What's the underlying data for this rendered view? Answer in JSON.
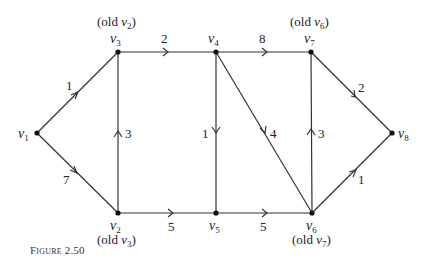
{
  "figure": {
    "caption": "Figure 2.50"
  },
  "nodes": [
    {
      "id": "v1",
      "label": "v",
      "sub": "1",
      "x": 37,
      "y": 133,
      "old": ""
    },
    {
      "id": "v2",
      "label": "v",
      "sub": "2",
      "x": 118,
      "y": 213,
      "old": "(old v3)",
      "old_main": "(old ",
      "old_v": "v",
      "old_sub": "3",
      "old_end": ")"
    },
    {
      "id": "v3",
      "label": "v",
      "sub": "3",
      "x": 118,
      "y": 52,
      "old": "(old v2)",
      "old_main": "(old ",
      "old_v": "v",
      "old_sub": "2",
      "old_end": ")"
    },
    {
      "id": "v4",
      "label": "v",
      "sub": "4",
      "x": 216,
      "y": 52,
      "old": ""
    },
    {
      "id": "v5",
      "label": "v",
      "sub": "5",
      "x": 216,
      "y": 213,
      "old": ""
    },
    {
      "id": "v6",
      "label": "v",
      "sub": "6",
      "x": 312,
      "y": 213,
      "old": "(old v7)",
      "old_main": "(old ",
      "old_v": "v",
      "old_sub": "7",
      "old_end": ")"
    },
    {
      "id": "v7",
      "label": "v",
      "sub": "7",
      "x": 311,
      "y": 52,
      "old": "(old v6)",
      "old_main": "(old ",
      "old_v": "v",
      "old_sub": "6",
      "old_end": ")"
    },
    {
      "id": "v8",
      "label": "v",
      "sub": "8",
      "x": 392,
      "y": 133,
      "old": ""
    }
  ],
  "edges": [
    {
      "from": "v1",
      "to": "v3",
      "weight": "1"
    },
    {
      "from": "v1",
      "to": "v2",
      "weight": "7"
    },
    {
      "from": "v3",
      "to": "v4",
      "weight": "2"
    },
    {
      "from": "v2",
      "to": "v3",
      "weight": "3"
    },
    {
      "from": "v4",
      "to": "v5",
      "weight": "1"
    },
    {
      "from": "v4",
      "to": "v6",
      "weight": "4"
    },
    {
      "from": "v4",
      "to": "v7",
      "weight": "8"
    },
    {
      "from": "v2",
      "to": "v5",
      "weight": "5"
    },
    {
      "from": "v5",
      "to": "v6",
      "weight": "5"
    },
    {
      "from": "v6",
      "to": "v7",
      "weight": "3"
    },
    {
      "from": "v7",
      "to": "v8",
      "weight": "2"
    },
    {
      "from": "v6",
      "to": "v8",
      "weight": "1"
    }
  ]
}
